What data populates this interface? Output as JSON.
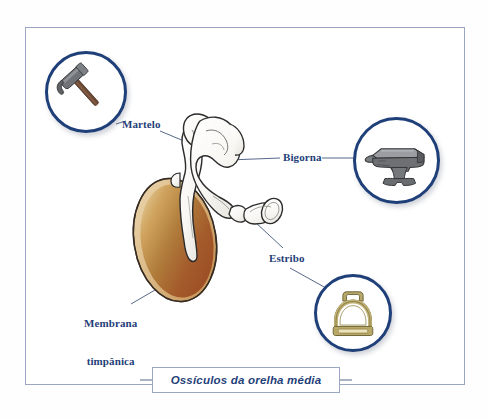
{
  "figure": {
    "caption": "Ossículos da orelha média",
    "frame": {
      "border_color": "#9aa6c4"
    },
    "palette": {
      "label_navy": "#1f3f79",
      "bubble_ring": "#1f3f79",
      "leader_line": "#44577d",
      "membrane_light": "#e0c48a",
      "membrane_mid": "#b5823f",
      "membrane_dark": "#9c4f27",
      "bone_fill": "#fbfbf9",
      "bone_outline": "#2b2b2b",
      "anvil_gray": "#6e7073",
      "anvil_light": "#9a9da1",
      "hammer_head": "#6f7276",
      "hammer_handle": "#6d4a35",
      "stirrup_brass": "#b5a66a",
      "stirrup_dark": "#8f8246"
    },
    "labels": [
      {
        "id": "martelo",
        "text": "Martelo",
        "icon": "hammer-icon"
      },
      {
        "id": "bigorna",
        "text": "Bigorna",
        "icon": "anvil-icon"
      },
      {
        "id": "estribo",
        "text": "Estribo",
        "icon": "stirrup-icon"
      },
      {
        "id": "membrana",
        "line1": "Membrana",
        "line2": "timpânica"
      }
    ],
    "icons": [
      {
        "name": "hammer-icon",
        "depicts": "claw hammer"
      },
      {
        "name": "anvil-icon",
        "depicts": "blacksmith anvil"
      },
      {
        "name": "stirrup-icon",
        "depicts": "riding stirrup"
      }
    ],
    "anatomy": [
      {
        "name": "tympanic-membrane",
        "label_ref": "membrana"
      },
      {
        "name": "malleus-bone",
        "label_ref": "martelo"
      },
      {
        "name": "incus-bone",
        "label_ref": "bigorna"
      },
      {
        "name": "stapes-bone",
        "label_ref": "estribo"
      }
    ]
  }
}
